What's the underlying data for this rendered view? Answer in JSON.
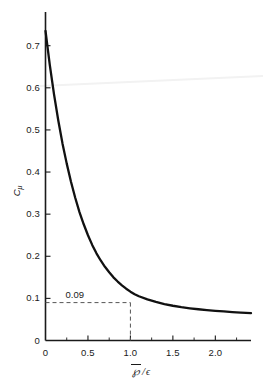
{
  "chart_data": {
    "type": "line",
    "title": "",
    "xlabel": "P̅/ε",
    "xlabel_numerator": "℘",
    "xlabel_separator": "/",
    "xlabel_denominator": "ϵ",
    "ylabel": "C",
    "ylabel_subscript": "μ",
    "xlim": [
      0,
      2.42
    ],
    "ylim": [
      0,
      0.78
    ],
    "xticks": [
      0,
      0.5,
      1.0,
      1.5,
      2.0
    ],
    "xtick_labels": [
      "0",
      "0.5",
      "1.0",
      "1.5",
      "2.0"
    ],
    "xminor_ticks": [
      0.25,
      0.75,
      1.25,
      1.75,
      2.25
    ],
    "yticks": [
      0,
      0.1,
      0.2,
      0.3,
      0.4,
      0.5,
      0.6,
      0.7
    ],
    "ytick_labels": [
      "0",
      "0.1",
      "0.2",
      "0.3",
      "0.4",
      "0.5",
      "0.6",
      "0.7"
    ],
    "grid": false,
    "legend": null,
    "series": [
      {
        "name": "C_mu",
        "x": [
          0.0,
          0.05,
          0.1,
          0.15,
          0.2,
          0.25,
          0.3,
          0.35,
          0.4,
          0.45,
          0.5,
          0.55,
          0.6,
          0.65,
          0.7,
          0.75,
          0.8,
          0.85,
          0.9,
          0.95,
          1.0,
          1.05,
          1.1,
          1.2,
          1.3,
          1.4,
          1.5,
          1.6,
          1.7,
          1.8,
          1.9,
          2.0,
          2.1,
          2.2,
          2.3,
          2.42
        ],
        "values": [
          0.735,
          0.655,
          0.585,
          0.523,
          0.468,
          0.42,
          0.377,
          0.339,
          0.305,
          0.276,
          0.25,
          0.227,
          0.207,
          0.19,
          0.175,
          0.162,
          0.15,
          0.14,
          0.131,
          0.123,
          0.116,
          0.11,
          0.105,
          0.0975,
          0.0915,
          0.0865,
          0.0825,
          0.0792,
          0.0765,
          0.0742,
          0.0722,
          0.0705,
          0.069,
          0.0676,
          0.0664,
          0.065
        ]
      }
    ],
    "annotations": [
      {
        "name": "cmu-reference-value",
        "label": "0.09",
        "value": 0.09,
        "x_at_value": 1.0,
        "guide_horizontal": true,
        "guide_vertical": true,
        "line_style": "dashed"
      }
    ],
    "colors": {
      "curve": "#111111",
      "axis": "#1a1a1a",
      "guide": "#555555",
      "background": "#ffffff",
      "artifact": "#f1f1f1"
    }
  }
}
